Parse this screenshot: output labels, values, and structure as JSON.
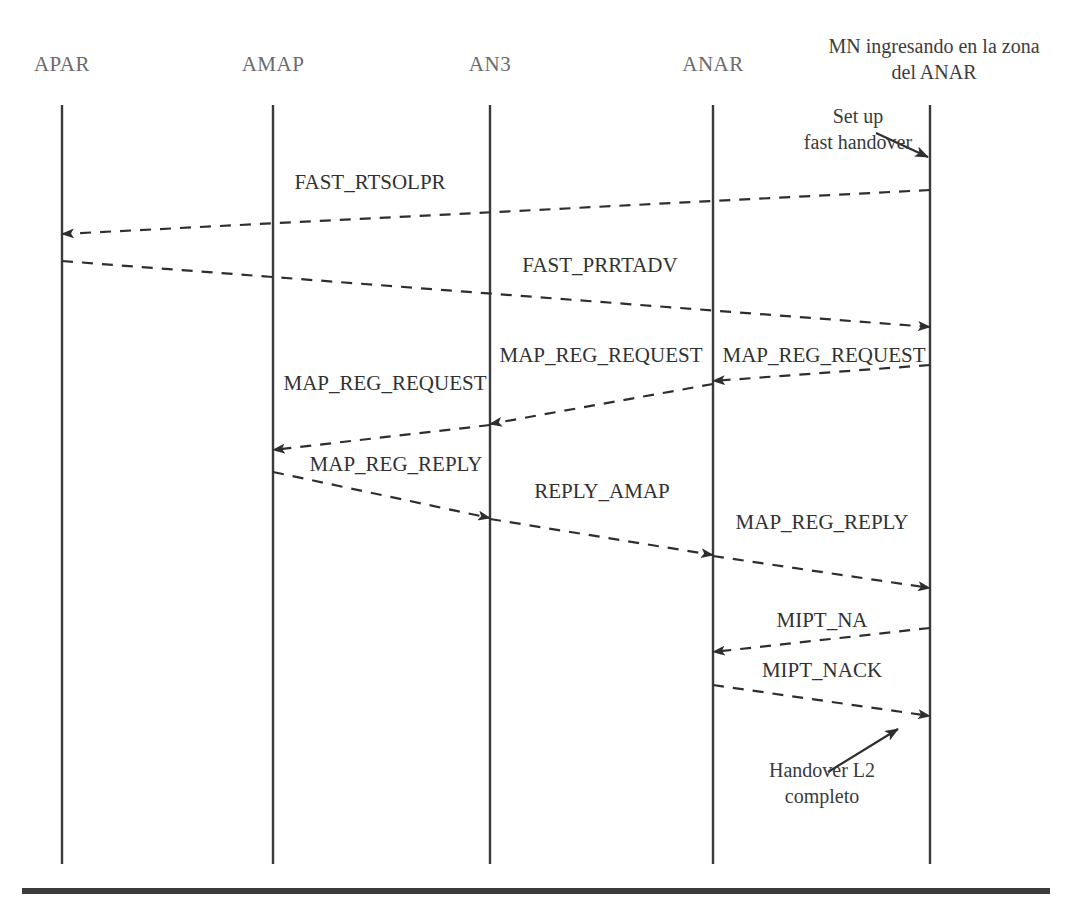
{
  "diagram": {
    "type": "sequence-diagram",
    "title_visible": false,
    "background_color": "#ffffff",
    "line_color": "#3b3b3b",
    "text_color": "#313131",
    "lifelines": [
      {
        "id": "apar",
        "label": "APAR",
        "x": 62,
        "label_style": "faded"
      },
      {
        "id": "amap",
        "label": "AMAP",
        "x": 273,
        "label_style": "faded"
      },
      {
        "id": "an3",
        "label": "AN3",
        "x": 490,
        "label_style": "faded"
      },
      {
        "id": "anar",
        "label": "ANAR",
        "x": 713,
        "label_style": "faded"
      },
      {
        "id": "mn",
        "label": "MN ingresando en la zona del ANAR",
        "x": 930,
        "label_style": "multiline"
      }
    ],
    "lifeline_top": 105,
    "lifeline_bottom": 864,
    "messages": [
      {
        "id": "m1",
        "label": "FAST_RTSOLPR",
        "from": "mn",
        "to": "apar",
        "x1": 930,
        "y1": 190,
        "x2": 62,
        "y2": 234,
        "label_x": 370,
        "label_y": 182,
        "style": "dashed"
      },
      {
        "id": "m2",
        "label": "FAST_PRRTADV",
        "from": "apar",
        "to": "mn",
        "x1": 62,
        "y1": 261,
        "x2": 930,
        "y2": 327,
        "label_x": 600,
        "label_y": 265,
        "style": "dashed"
      },
      {
        "id": "m3",
        "label": "MAP_REG_REQUEST",
        "from": "mn",
        "to": "anar",
        "x1": 930,
        "y1": 365,
        "x2": 713,
        "y2": 381,
        "label_x": 822,
        "label_y": 355,
        "style": "dashed"
      },
      {
        "id": "m4",
        "label": "MAP_REG_REQUEST",
        "from": "anar",
        "to": "an3",
        "x1": 713,
        "y1": 384,
        "x2": 490,
        "y2": 424,
        "label_x": 601,
        "label_y": 355,
        "style": "dashed"
      },
      {
        "id": "m5",
        "label": "MAP_REG_REQUEST",
        "from": "an3",
        "to": "amap",
        "x1": 490,
        "y1": 425,
        "x2": 273,
        "y2": 450,
        "label_x": 385,
        "label_y": 383,
        "style": "dashed"
      },
      {
        "id": "m6",
        "label": "MAP_REG_REPLY",
        "from": "amap",
        "to": "an3",
        "x1": 273,
        "y1": 472,
        "x2": 490,
        "y2": 518,
        "label_x": 396,
        "label_y": 464,
        "style": "dashed"
      },
      {
        "id": "m7",
        "label": "REPLY_AMAP",
        "from": "an3",
        "to": "anar",
        "x1": 490,
        "y1": 519,
        "x2": 713,
        "y2": 555,
        "label_x": 602,
        "label_y": 491,
        "style": "dashed"
      },
      {
        "id": "m8",
        "label": "MAP_REG_REPLY",
        "from": "anar",
        "to": "mn",
        "x1": 713,
        "y1": 556,
        "x2": 930,
        "y2": 588,
        "label_x": 822,
        "label_y": 522,
        "style": "dashed"
      },
      {
        "id": "m9",
        "label": "MIPT_NA",
        "from": "mn",
        "to": "anar",
        "x1": 930,
        "y1": 628,
        "x2": 713,
        "y2": 652,
        "label_x": 822,
        "label_y": 620,
        "style": "dashed"
      },
      {
        "id": "m10",
        "label": "MIPT_NACK",
        "from": "anar",
        "to": "mn",
        "x1": 713,
        "y1": 685,
        "x2": 930,
        "y2": 716,
        "label_x": 822,
        "label_y": 670,
        "style": "dashed"
      }
    ],
    "annotations": [
      {
        "id": "note-setup",
        "text": "Set up fast handover",
        "line1": "Set up",
        "line2": "fast handover",
        "x": 860,
        "y": 105,
        "arrow": {
          "x1": 880,
          "y1": 135,
          "x2": 930,
          "y2": 155
        }
      },
      {
        "id": "note-handover",
        "text": "Handover L2 completo",
        "line1": "Handover L2",
        "line2": "completo",
        "x": 822,
        "y": 758,
        "arrow": {
          "x1": 830,
          "y1": 772,
          "x2": 900,
          "y2": 730
        }
      }
    ],
    "bottom_rule": {
      "y": 888,
      "x": 22,
      "width": 1028,
      "height": 6
    }
  }
}
